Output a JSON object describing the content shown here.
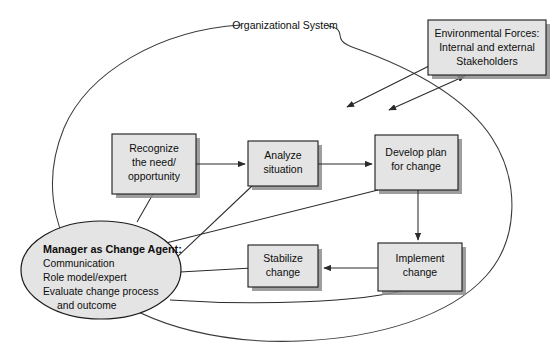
{
  "diagram": {
    "title": "Organizational System",
    "system_label": "Organizational System",
    "colors": {
      "node_fill": "#e4e4e4",
      "node_stroke": "#1a1a1a",
      "shadow": "#8d8d8d",
      "connector": "#2b2b2b",
      "background": "#ffffff",
      "text": "#0d0d0d"
    },
    "nodes": {
      "environmental_forces": {
        "lines": [
          "Environmental Forces:",
          "Internal and external",
          "Stakeholders"
        ]
      },
      "recognize": {
        "lines": [
          "Recognize",
          "the need/",
          "opportunity"
        ]
      },
      "analyze": {
        "lines": [
          "Analyze",
          "situation"
        ]
      },
      "develop_plan": {
        "lines": [
          "Develop plan",
          "for change"
        ]
      },
      "implement": {
        "lines": [
          "Implement",
          "change"
        ]
      },
      "stabilize": {
        "lines": [
          "Stabilize",
          "change"
        ]
      },
      "manager": {
        "title": "Manager as Change Agent:",
        "lines": [
          "Communication",
          "Role model/expert",
          "Evaluate change process",
          "and outcome"
        ]
      }
    }
  }
}
